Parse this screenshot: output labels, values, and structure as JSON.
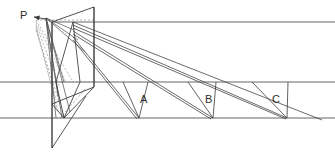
{
  "figure": {
    "kind": "perspective-projection-diagram",
    "width": 335,
    "height": 155,
    "background_color": "#ffffff",
    "line_color": "#3a3a3a",
    "construction_line_color": "#8d8d8d",
    "label_color": "#2b2b2b"
  },
  "labels": {
    "viewpoint": "P",
    "object_a": "A",
    "object_b": "B",
    "object_c": "C"
  },
  "label_positions": {
    "viewpoint": {
      "x": 20,
      "y": 19
    },
    "object_a": {
      "x": 140,
      "y": 103
    },
    "object_b": {
      "x": 205,
      "y": 103
    },
    "object_c": {
      "x": 272,
      "y": 103
    }
  },
  "horizontal_lines": [
    {
      "name": "horizon-line",
      "x1": 52,
      "y1": 22,
      "x2": 335,
      "y2": 22
    },
    {
      "name": "middle-ground-line",
      "x1": 0,
      "y1": 82,
      "x2": 335,
      "y2": 82
    },
    {
      "name": "base-ground-line",
      "x1": 0,
      "y1": 118,
      "x2": 335,
      "y2": 118
    }
  ],
  "picture_plane": {
    "name": "picture-plane",
    "points": "52,22 94,7 94,87 52,104"
  },
  "vertical_edges": [
    {
      "name": "plane-left-edge",
      "x1": 52,
      "y1": 22,
      "x2": 52,
      "y2": 148
    },
    {
      "name": "plane-right-edge",
      "x1": 94,
      "y1": 7,
      "x2": 94,
      "y2": 87
    }
  ],
  "viewpoint_marker": {
    "name": "viewpoint-arrow",
    "tip_x": 34,
    "tip_y": 17,
    "tail_x": 46,
    "tail_y": 19
  },
  "projection_rays": [
    {
      "name": "ray-p-to-a-top",
      "x1": 46,
      "y1": 18,
      "x2": 74,
      "y2": 30
    },
    {
      "name": "ray-p-to-a-base",
      "x1": 46,
      "y1": 18,
      "x2": 62,
      "y2": 118
    },
    {
      "name": "ray-p-to-b-top",
      "x1": 46,
      "y1": 18,
      "x2": 78,
      "y2": 40
    },
    {
      "name": "ray-p-to-b-base",
      "x1": 46,
      "y1": 18,
      "x2": 70,
      "y2": 112
    },
    {
      "name": "ray-p-to-c-top",
      "x1": 46,
      "y1": 18,
      "x2": 85,
      "y2": 52
    },
    {
      "name": "ray-p-to-c-base",
      "x1": 46,
      "y1": 18,
      "x2": 58,
      "y2": 96
    },
    {
      "name": "ray-p-lower-1",
      "x1": 46,
      "y1": 18,
      "x2": 64,
      "y2": 82
    },
    {
      "name": "ray-p-lower-2",
      "x1": 46,
      "y1": 18,
      "x2": 56,
      "y2": 118
    }
  ],
  "sight_rays": [
    {
      "name": "sight-ray-1",
      "x1": 73,
      "y1": 22,
      "x2": 322,
      "y2": 120
    },
    {
      "name": "sight-ray-2",
      "x1": 73,
      "y1": 25,
      "x2": 287,
      "y2": 118
    },
    {
      "name": "sight-ray-3",
      "x1": 73,
      "y1": 28,
      "x2": 286,
      "y2": 119
    },
    {
      "name": "sight-ray-4",
      "x1": 73,
      "y1": 31,
      "x2": 213,
      "y2": 118
    },
    {
      "name": "sight-ray-5",
      "x1": 73,
      "y1": 34,
      "x2": 211,
      "y2": 119
    },
    {
      "name": "sight-ray-6",
      "x1": 73,
      "y1": 37,
      "x2": 139,
      "y2": 118
    },
    {
      "name": "sight-ray-7",
      "x1": 73,
      "y1": 40,
      "x2": 137,
      "y2": 119
    }
  ],
  "object_a_rays": [
    {
      "name": "object-a-ray-top",
      "x1": 148,
      "y1": 82,
      "x2": 139,
      "y2": 118
    },
    {
      "name": "object-a-ray-side",
      "x1": 123,
      "y1": 82,
      "x2": 139,
      "y2": 118
    }
  ],
  "object_b_rays": [
    {
      "name": "object-b-ray-top",
      "x1": 216,
      "y1": 82,
      "x2": 213,
      "y2": 118
    },
    {
      "name": "object-b-ray-side",
      "x1": 188,
      "y1": 82,
      "x2": 213,
      "y2": 118
    }
  ],
  "object_c_rays": [
    {
      "name": "object-c-ray-top",
      "x1": 288,
      "y1": 82,
      "x2": 287,
      "y2": 118
    },
    {
      "name": "object-c-ray-side",
      "x1": 252,
      "y1": 82,
      "x2": 287,
      "y2": 118
    }
  ],
  "central_object": {
    "name": "central-object-outline",
    "points": "73,22 80,82 64,118 56,82"
  },
  "lower_structure": [
    {
      "name": "lower-edge-left",
      "x1": 52,
      "y1": 148,
      "x2": 52,
      "y2": 104
    },
    {
      "name": "lower-edge-diagonal",
      "x1": 52,
      "y1": 148,
      "x2": 86,
      "y2": 96
    },
    {
      "name": "lower-edge-base",
      "x1": 52,
      "y1": 104,
      "x2": 64,
      "y2": 118
    },
    {
      "name": "lower-edge-to-plane",
      "x1": 64,
      "y1": 118,
      "x2": 94,
      "y2": 87
    }
  ],
  "dashed_construction": [
    {
      "name": "dashed-p-1",
      "x1": 34,
      "y1": 17,
      "x2": 52,
      "y2": 22
    },
    {
      "name": "dashed-p-2",
      "x1": 36,
      "y1": 20,
      "x2": 72,
      "y2": 80
    },
    {
      "name": "dashed-p-3",
      "x1": 36,
      "y1": 22,
      "x2": 66,
      "y2": 82
    },
    {
      "name": "dashed-p-4",
      "x1": 36,
      "y1": 24,
      "x2": 60,
      "y2": 88
    },
    {
      "name": "dashed-p-5",
      "x1": 36,
      "y1": 26,
      "x2": 56,
      "y2": 100
    },
    {
      "name": "dashed-p-6",
      "x1": 36,
      "y1": 28,
      "x2": 58,
      "y2": 112
    },
    {
      "name": "dashed-p-7",
      "x1": 36,
      "y1": 30,
      "x2": 64,
      "y2": 117
    },
    {
      "name": "dashed-horizontal",
      "x1": 36,
      "y1": 20,
      "x2": 94,
      "y2": 20
    },
    {
      "name": "dashed-mid",
      "x1": 52,
      "y1": 82,
      "x2": 94,
      "y2": 82
    },
    {
      "name": "dashed-base",
      "x1": 52,
      "y1": 118,
      "x2": 70,
      "y2": 118
    },
    {
      "name": "dashed-rising",
      "x1": 60,
      "y1": 118,
      "x2": 86,
      "y2": 88
    }
  ]
}
